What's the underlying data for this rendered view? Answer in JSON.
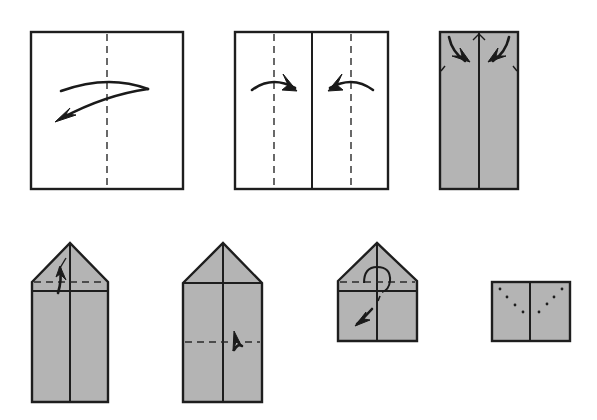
{
  "diagram": {
    "type": "origami-fold-instructions",
    "colors": {
      "paper_front": "#ffffff",
      "paper_back": "#b4b4b4",
      "line": "#1e1e1e"
    },
    "steps": [
      {
        "index": 1,
        "shape": "square",
        "paper": "white",
        "marks": [
          "vertical valley fold center",
          "fold arrow right-to-left"
        ]
      },
      {
        "index": 2,
        "shape": "square",
        "paper": "white",
        "marks": [
          "center crease",
          "two valley folds",
          "edges fold to center arrows"
        ]
      },
      {
        "index": 3,
        "shape": "tall rectangle",
        "paper": "gray",
        "marks": [
          "center crease",
          "top corners fold-down arrows"
        ]
      },
      {
        "index": 4,
        "shape": "house pentagon",
        "paper": "gray",
        "marks": [
          "triangle top",
          "valley fold across",
          "fold-down arrow"
        ]
      },
      {
        "index": 5,
        "shape": "house pentagon",
        "paper": "gray",
        "marks": [
          "center crease",
          "horizontal valley fold",
          "fold-up arrow"
        ]
      },
      {
        "index": 6,
        "shape": "short house",
        "paper": "gray",
        "marks": [
          "valley fold",
          "turn-over loop arrow",
          "fold-down arrow"
        ]
      },
      {
        "index": 7,
        "shape": "small rectangle",
        "paper": "gray",
        "marks": [
          "center crease",
          "dotted V guide lines"
        ]
      }
    ]
  }
}
